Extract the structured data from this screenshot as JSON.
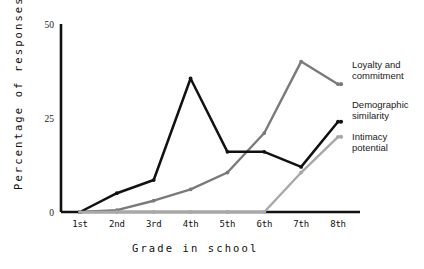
{
  "chart_data": {
    "type": "line",
    "title": "",
    "subtitle": "",
    "xlabel": "Grade in school",
    "ylabel": "Percentage of responses",
    "categories": [
      "1st",
      "2nd",
      "3rd",
      "4th",
      "5th",
      "6th",
      "7th",
      "8th"
    ],
    "ylim": [
      0,
      50
    ],
    "yticks": [
      0,
      25,
      50
    ],
    "ytick_labels": [
      "0",
      "25",
      "50"
    ],
    "grid": false,
    "legend_position": "right",
    "series": [
      {
        "name": "Loyalty and commitment",
        "color": "#7a7a7a",
        "values": [
          0,
          0.5,
          3,
          6,
          10.5,
          21,
          40,
          34
        ]
      },
      {
        "name": "Demographic similarity",
        "color": "#111111",
        "values": [
          0,
          5,
          8.5,
          35.5,
          16,
          16,
          12,
          24
        ]
      },
      {
        "name": "Intimacy potential",
        "color": "#a8a8a8",
        "values": [
          0,
          0,
          0,
          0,
          0,
          0,
          10.5,
          20
        ]
      }
    ]
  },
  "legend": {
    "entries": [
      {
        "label_line1": "Loyalty and",
        "label_line2": "commitment"
      },
      {
        "label_line1": "Demographic",
        "label_line2": "similarity"
      },
      {
        "label_line1": "Intimacy",
        "label_line2": "potential"
      }
    ]
  },
  "axes": {
    "y_title": "Percentage of responses",
    "x_title": "Grade in school"
  }
}
